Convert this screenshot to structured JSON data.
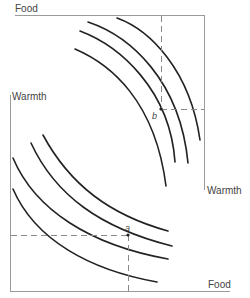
{
  "diagram": {
    "type": "indifference-curves",
    "colors": {
      "axis": "#9a9a9a",
      "curve": "#222222",
      "dash": "#888888",
      "text": "#444444"
    },
    "top_panel": {
      "vertical_axis_label": "Food",
      "horizontal_axis_label": "Warmth",
      "point_label": "b",
      "curve_count": 4
    },
    "bottom_panel": {
      "vertical_axis_label": "Warmth",
      "horizontal_axis_label": "Food",
      "point_label": "a",
      "curve_count": 4
    }
  }
}
